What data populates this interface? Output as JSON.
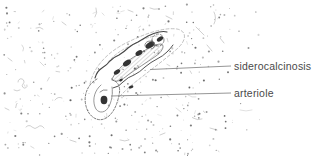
{
  "figure": {
    "annotations": {
      "siderocalcinosis": {
        "label": "siderocalcinosis"
      },
      "arteriole": {
        "label": "arteriole"
      }
    },
    "colors": {
      "background": "#ffffff",
      "ink": "#3c3c3c",
      "contour": "#8c8c8c",
      "leader_line": "#8a8a8a",
      "label_text": "#4a4a4a"
    }
  }
}
